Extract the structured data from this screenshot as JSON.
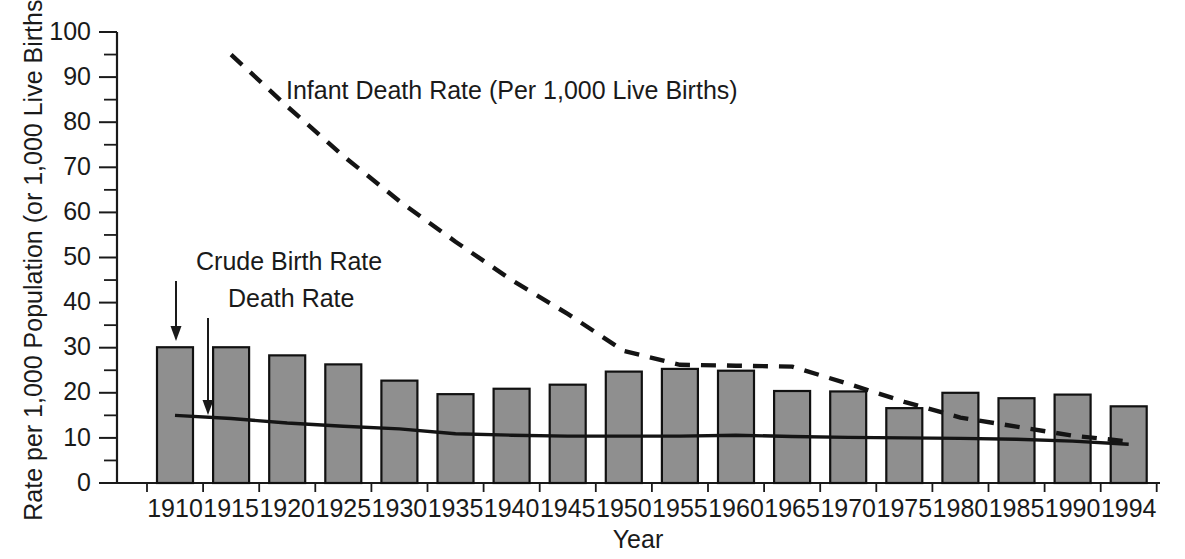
{
  "chart_data": {
    "type": "bar",
    "title": "",
    "xlabel": "Year",
    "ylabel": "Rate per 1,000 Population (or 1,000 Live Births)",
    "ylim": [
      0,
      100
    ],
    "ytick_step": 10,
    "yminor_step": 5,
    "grid": false,
    "legend_position": "inline-annotations",
    "categories": [
      "1910",
      "1915",
      "1920",
      "1925",
      "1930",
      "1935",
      "1940",
      "1945",
      "1950",
      "1955",
      "1960",
      "1965",
      "1970",
      "1975",
      "1980",
      "1985",
      "1990",
      "1994"
    ],
    "series": [
      {
        "name": "Crude Birth Rate",
        "render": "bar",
        "values": [
          30.1,
          30.1,
          28.3,
          26.3,
          22.7,
          19.7,
          20.9,
          21.8,
          24.7,
          25.3,
          24.9,
          20.4,
          20.3,
          16.6,
          20.0,
          18.8,
          19.6,
          17.0
        ]
      },
      {
        "name": "Death Rate",
        "render": "solid-line",
        "values": [
          15.0,
          14.3,
          13.3,
          12.6,
          12.0,
          10.9,
          10.6,
          10.4,
          10.4,
          10.4,
          10.6,
          10.3,
          10.1,
          10.0,
          9.9,
          9.7,
          9.3,
          8.6
        ]
      },
      {
        "name": "Infant Death Rate (Per 1,000 Live Births)",
        "render": "dashed-line",
        "start_category": "1915",
        "values": [
          null,
          95.0,
          83.5,
          72.5,
          62.5,
          53.5,
          45.0,
          37.5,
          29.3,
          26.2,
          26.0,
          25.8,
          22.0,
          18.0,
          14.5,
          12.5,
          10.5,
          9.2
        ]
      }
    ],
    "annotations": [
      {
        "text": "Infant Death Rate (Per 1,000 Live Births)",
        "x": 286,
        "y": 99
      },
      {
        "text": "Crude Birth Rate",
        "x": 196,
        "y": 270
      },
      {
        "text": "Death Rate",
        "x": 228,
        "y": 307
      }
    ]
  }
}
